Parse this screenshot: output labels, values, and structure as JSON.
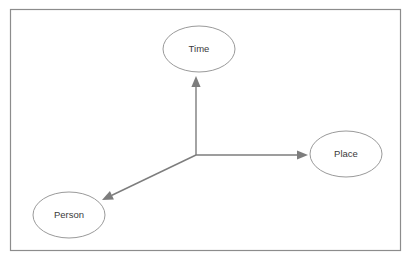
{
  "diagram": {
    "background_color": "#ffffff",
    "frame": {
      "name": "outer-border",
      "x": 10,
      "y": 9,
      "width": 390,
      "height": 241,
      "stroke_color": "#8c8c8c"
    },
    "hub": {
      "label": "",
      "x": 196,
      "y": 155
    },
    "nodes": [
      {
        "id": "time",
        "label": "Time",
        "cx": 199,
        "cy": 49,
        "rx": 36,
        "ry": 23,
        "stroke_color": "#9a9a9a",
        "fill_color": "#ffffff",
        "text_color": "#3a3a3a"
      },
      {
        "id": "place",
        "label": "Place",
        "cx": 346,
        "cy": 154,
        "rx": 36,
        "ry": 23,
        "stroke_color": "#9a9a9a",
        "fill_color": "#ffffff",
        "text_color": "#3a3a3a"
      },
      {
        "id": "person",
        "label": "Person",
        "cx": 69,
        "cy": 215,
        "rx": 36,
        "ry": 23,
        "stroke_color": "#9a9a9a",
        "fill_color": "#ffffff",
        "text_color": "#3a3a3a"
      }
    ],
    "connectors": [
      {
        "id": "hub-to-time",
        "from": "hub",
        "to": "time",
        "x1": 196,
        "y1": 155,
        "x2": 196,
        "y2": 76,
        "arrow": "end",
        "stroke_color": "#7d7d7d"
      },
      {
        "id": "hub-to-place",
        "from": "hub",
        "to": "place",
        "x1": 196,
        "y1": 155,
        "x2": 308,
        "y2": 155,
        "arrow": "end",
        "stroke_color": "#7d7d7d"
      },
      {
        "id": "hub-to-person",
        "from": "hub",
        "to": "person",
        "x1": 196,
        "y1": 155,
        "x2": 102,
        "y2": 200,
        "arrow": "end",
        "stroke_color": "#7d7d7d"
      }
    ]
  }
}
